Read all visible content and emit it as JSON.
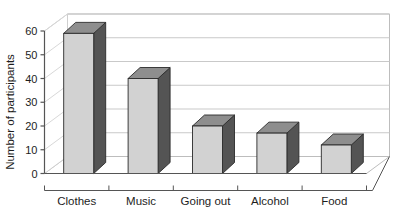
{
  "chart_data": {
    "type": "bar",
    "title": "",
    "subtitle": "",
    "xlabel": "",
    "ylabel": "Number of participants",
    "categories": [
      "Clothes",
      "Music",
      "Going out",
      "Alcohol",
      "Food"
    ],
    "values": [
      59,
      40,
      20,
      17,
      12
    ],
    "series": [
      {
        "name": "Number of participants",
        "values": [
          59,
          40,
          20,
          17,
          12
        ]
      }
    ],
    "ylim": [
      0,
      60
    ],
    "yticks": [
      0,
      10,
      20,
      30,
      40,
      50,
      60
    ],
    "ytick_labels": [
      "0",
      "10",
      "20",
      "30",
      "40",
      "50",
      "60"
    ],
    "grid": true,
    "grid_axis": "y",
    "legend": false,
    "legend_position": "none",
    "three_d": true,
    "annotations": []
  },
  "style": {
    "bar_front_color": "#d2d2d2",
    "bar_side_color": "#545454",
    "bar_top_color": "#8e8e8e",
    "bar_edge_color": "#2b2b2b",
    "grid_color": "#c9c9c9",
    "axis_color": "#555555",
    "wall_color": "#ffffff",
    "floor_color": "#ffffff",
    "text_color": "#1d1d1d",
    "background": "#ffffff"
  }
}
